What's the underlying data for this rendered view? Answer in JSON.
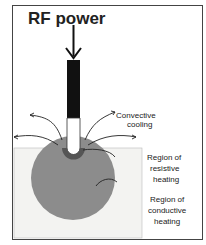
{
  "title": "RF power",
  "labels": {
    "convective_1": "Convective",
    "convective_2": "cooling",
    "resistive_1": "Region  of",
    "resistive_2": "resistive",
    "resistive_3": "heating",
    "conductive_1": "Region  of",
    "conductive_2": "conductive",
    "conductive_3": "heating"
  },
  "colors": {
    "tissue": "#f3f3f1",
    "conductive": "#8c8c8c",
    "resistive": "#555555",
    "probe": "#111111"
  }
}
